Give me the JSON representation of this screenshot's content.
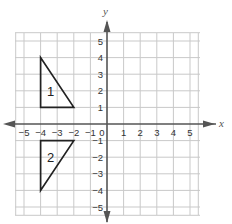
{
  "diagram": {
    "type": "coordinate-grid",
    "axes": {
      "x_label": "x",
      "y_label": "y",
      "x_range": [
        -5,
        5
      ],
      "y_range": [
        -5,
        5
      ]
    },
    "x_ticks": [
      "−5",
      "−4",
      "−3",
      "−2",
      "−1",
      "0",
      "1",
      "2",
      "3",
      "4",
      "5"
    ],
    "y_ticks_positive": [
      "5",
      "4",
      "3",
      "2",
      "1"
    ],
    "y_ticks_negative": [
      "−1",
      "−2",
      "−3",
      "−4",
      "−5"
    ],
    "shapes": [
      {
        "label": "1",
        "vertices": [
          [
            -4,
            4
          ],
          [
            -4,
            1
          ],
          [
            -2,
            1
          ]
        ]
      },
      {
        "label": "2",
        "vertices": [
          [
            -4,
            -1
          ],
          [
            -2,
            -1
          ],
          [
            -4,
            -4
          ]
        ]
      }
    ],
    "colors": {
      "grid": "#c9c9c9",
      "axis": "#555555",
      "shape": "#222222"
    }
  }
}
